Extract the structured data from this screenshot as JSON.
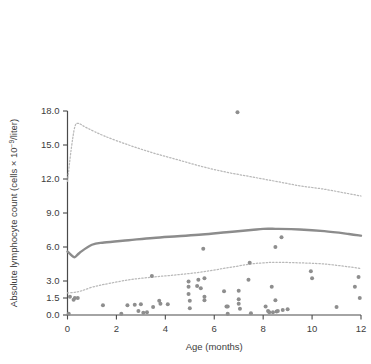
{
  "chart_data": {
    "type": "scatter",
    "title": "",
    "xlabel": "Age (months)",
    "ylabel": "Absolute lymphocyte count (cells × 10⁻⁹/liter)",
    "ylabel_parts": {
      "prefix": "Absolute lymphocyte count (cells × 10",
      "exponent": "−9",
      "suffix": "/liter)"
    },
    "xlim": [
      0,
      12
    ],
    "ylim": [
      0,
      18
    ],
    "grid": false,
    "legend": "none",
    "xticks": [
      0,
      2,
      4,
      6,
      8,
      10,
      12
    ],
    "xtick_labels": [
      "0",
      "2",
      "4",
      "6",
      "8",
      "10",
      "12"
    ],
    "yticks": [
      0.0,
      1.5,
      3.0,
      6.0,
      9.0,
      12.0,
      15.0,
      18.0
    ],
    "ytick_labels": [
      "0.0",
      "1.5",
      "3.0",
      "6.0",
      "9.0",
      "12.0",
      "15.0",
      "18.0"
    ],
    "ytick_note": "non-uniform: 0.0 to 1.5 to 3.0 then 3.0 steps",
    "series": [
      {
        "name": "upper reference limit",
        "type": "line",
        "style": "dotted",
        "color": "#b9b9b9",
        "x": [
          0.0,
          0.15,
          0.3,
          0.45,
          0.8,
          1.5,
          2.5,
          3.5,
          4.5,
          5.5,
          6.5,
          7.5,
          8.5,
          9.5,
          10.5,
          11.5,
          12.0
        ],
        "y": [
          11.8,
          14.6,
          16.6,
          16.9,
          16.5,
          15.8,
          15.0,
          14.3,
          13.7,
          13.1,
          12.6,
          12.2,
          11.8,
          11.4,
          11.1,
          10.7,
          10.5
        ]
      },
      {
        "name": "median",
        "type": "line",
        "style": "solid",
        "color": "#8c8c8c",
        "x": [
          0.0,
          0.15,
          0.3,
          0.5,
          1.0,
          1.5,
          2.5,
          3.5,
          4.5,
          5.5,
          6.5,
          7.5,
          8.0,
          8.5,
          9.5,
          10.5,
          11.5,
          12.0
        ],
        "y": [
          5.6,
          5.3,
          5.1,
          5.5,
          6.2,
          6.4,
          6.6,
          6.8,
          6.95,
          7.1,
          7.3,
          7.5,
          7.6,
          7.6,
          7.55,
          7.4,
          7.15,
          7.0
        ]
      },
      {
        "name": "lower reference limit",
        "type": "line",
        "style": "dotted",
        "color": "#b9b9b9",
        "x": [
          0.0,
          0.3,
          0.6,
          1.0,
          1.5,
          2.5,
          3.5,
          4.5,
          5.5,
          6.5,
          7.5,
          8.0,
          8.5,
          9.5,
          10.5,
          11.5,
          12.0
        ],
        "y": [
          1.95,
          2.0,
          2.15,
          2.45,
          2.7,
          3.1,
          3.35,
          3.55,
          3.8,
          4.15,
          4.5,
          4.6,
          4.65,
          4.6,
          4.5,
          4.25,
          4.1
        ]
      },
      {
        "name": "observed counts",
        "type": "scatter",
        "color": "#8e8e8e",
        "n_points": 70,
        "points": [
          [
            0.05,
            0.1
          ],
          [
            0.1,
            1.6
          ],
          [
            0.25,
            1.35
          ],
          [
            0.3,
            1.5
          ],
          [
            0.42,
            1.5
          ],
          [
            1.45,
            0.85
          ],
          [
            2.2,
            0.1
          ],
          [
            2.45,
            0.85
          ],
          [
            2.75,
            0.9
          ],
          [
            2.9,
            0.35
          ],
          [
            3.0,
            0.95
          ],
          [
            3.1,
            0.2
          ],
          [
            3.25,
            0.25
          ],
          [
            3.45,
            3.45
          ],
          [
            3.5,
            0.7
          ],
          [
            3.75,
            1.25
          ],
          [
            3.8,
            1.0
          ],
          [
            4.1,
            0.95
          ],
          [
            4.95,
            2.95
          ],
          [
            4.95,
            2.5
          ],
          [
            4.95,
            1.85
          ],
          [
            5.0,
            1.25
          ],
          [
            5.0,
            0.6
          ],
          [
            5.3,
            2.55
          ],
          [
            5.35,
            3.1
          ],
          [
            5.45,
            2.35
          ],
          [
            5.55,
            5.85
          ],
          [
            5.6,
            3.25
          ],
          [
            5.6,
            1.6
          ],
          [
            5.6,
            1.3
          ],
          [
            6.4,
            2.1
          ],
          [
            6.5,
            0.75
          ],
          [
            6.55,
            0.75
          ],
          [
            6.55,
            0.1
          ],
          [
            6.95,
            17.9
          ],
          [
            7.0,
            2.15
          ],
          [
            7.0,
            1.4
          ],
          [
            7.0,
            1.0
          ],
          [
            7.05,
            0.55
          ],
          [
            7.4,
            3.1
          ],
          [
            7.45,
            4.6
          ],
          [
            7.5,
            0.15
          ],
          [
            8.1,
            0.75
          ],
          [
            8.2,
            0.35
          ],
          [
            8.25,
            0.25
          ],
          [
            8.35,
            2.5
          ],
          [
            8.4,
            0.25
          ],
          [
            8.5,
            6.0
          ],
          [
            8.5,
            1.3
          ],
          [
            8.55,
            0.3
          ],
          [
            8.6,
            0.35
          ],
          [
            8.75,
            6.85
          ],
          [
            8.8,
            0.45
          ],
          [
            9.0,
            0.5
          ],
          [
            9.95,
            3.85
          ],
          [
            10.0,
            3.25
          ],
          [
            11.0,
            0.7
          ],
          [
            11.75,
            2.5
          ],
          [
            11.9,
            3.35
          ],
          [
            11.95,
            1.5
          ]
        ]
      }
    ]
  }
}
